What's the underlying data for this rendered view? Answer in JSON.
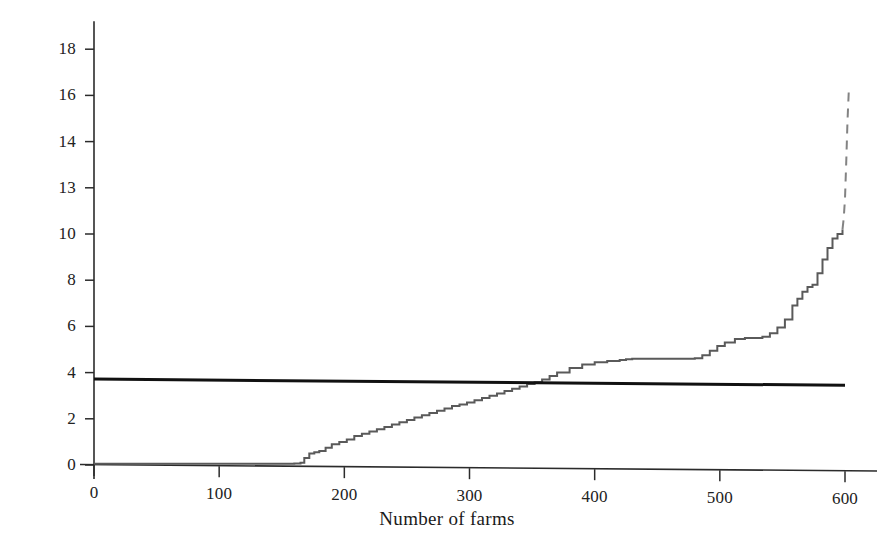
{
  "chart_data": {
    "type": "line",
    "title": "",
    "subtitle": "",
    "xlabel": "Number of farms",
    "ylabel": "Water acre-feet",
    "xlim": [
      0,
      630
    ],
    "ylim": [
      0,
      19.2
    ],
    "grid": false,
    "legend": "none",
    "xticks": [
      0,
      100,
      200,
      300,
      400,
      500,
      600
    ],
    "xtick_labels": [
      "0",
      "100",
      "200",
      "300",
      "400",
      "500",
      "600"
    ],
    "yticks": [
      0,
      2,
      4,
      6,
      8,
      10,
      13,
      14,
      16,
      18
    ],
    "ytick_labels": [
      "0",
      "2",
      "4",
      "6",
      "8",
      "10",
      "13",
      "14",
      "16",
      "18"
    ],
    "ytick_note": "Axis tick labels are unevenly captioned as printed: 0, 2, 4, 6, 8, 10, 13, 14, 16, 18 at evenly spaced positions",
    "annotations": [
      {
        "text": "curve crosses average line",
        "x": 306,
        "y": 3.6
      },
      {
        "text": "upper tail drawn as faded/broken line",
        "x": 578,
        "y": 11.5
      }
    ],
    "series": [
      {
        "name": "Water acre-feet per farm (sorted ascending)",
        "style": "stepped-line",
        "color": "#5a5a5a",
        "width": 2,
        "x": [
          0,
          20,
          40,
          60,
          80,
          100,
          120,
          140,
          160,
          165,
          168,
          172,
          176,
          180,
          185,
          190,
          196,
          202,
          208,
          214,
          220,
          226,
          232,
          238,
          244,
          250,
          256,
          262,
          268,
          274,
          280,
          286,
          292,
          298,
          304,
          310,
          316,
          322,
          328,
          334,
          340,
          346,
          352,
          358,
          364,
          370,
          380,
          390,
          400,
          410,
          420,
          425,
          430,
          436,
          442,
          450,
          460,
          470,
          480,
          486,
          492,
          498,
          504,
          512,
          520,
          528,
          534,
          540,
          546,
          552,
          558,
          562,
          566,
          570,
          574,
          578,
          582,
          586,
          590,
          594,
          598
        ],
        "y": [
          0.05,
          0.05,
          0.05,
          0.05,
          0.05,
          0.05,
          0.05,
          0.05,
          0.06,
          0.1,
          0.3,
          0.5,
          0.55,
          0.6,
          0.75,
          0.9,
          1.0,
          1.1,
          1.25,
          1.35,
          1.45,
          1.55,
          1.65,
          1.75,
          1.85,
          1.95,
          2.05,
          2.15,
          2.25,
          2.35,
          2.45,
          2.55,
          2.62,
          2.7,
          2.8,
          2.9,
          3.0,
          3.1,
          3.2,
          3.3,
          3.4,
          3.5,
          3.58,
          3.7,
          3.85,
          4.0,
          4.2,
          4.35,
          4.45,
          4.5,
          4.55,
          4.58,
          4.6,
          4.6,
          4.6,
          4.6,
          4.6,
          4.6,
          4.62,
          4.75,
          4.95,
          5.15,
          5.3,
          5.45,
          5.5,
          5.5,
          5.55,
          5.7,
          5.95,
          6.3,
          6.9,
          7.2,
          7.5,
          7.7,
          7.8,
          8.3,
          8.9,
          9.4,
          9.8,
          10.0,
          10.3
        ],
        "tail_dashed": {
          "comment": "faint broken continuation at the extreme right",
          "x": [
            598,
            599,
            600,
            601,
            602,
            603
          ],
          "y": [
            10.3,
            11.0,
            12.3,
            13.6,
            14.9,
            16.2
          ]
        }
      },
      {
        "name": "Average water allotment",
        "style": "straight-line",
        "color": "#111111",
        "width": 3,
        "x": [
          0,
          600
        ],
        "y": [
          3.72,
          3.45
        ]
      }
    ]
  }
}
